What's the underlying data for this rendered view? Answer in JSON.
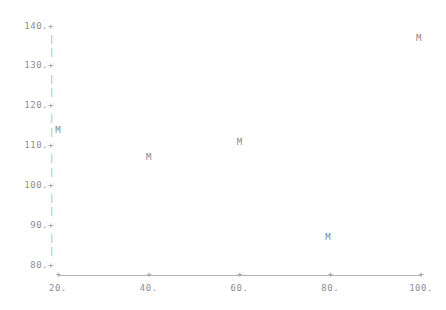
{
  "chart_data": {
    "type": "scatter",
    "title": "",
    "subtitle": "",
    "xlabel": "",
    "ylabel": "",
    "xlim": [
      20,
      100
    ],
    "ylim": [
      80,
      140
    ],
    "grid": false,
    "legend": null,
    "marker_symbol": "M",
    "x_ticks": [
      20,
      40,
      60,
      80,
      100
    ],
    "x_tick_labels": [
      "20.",
      "40.",
      "60.",
      "80.",
      "100."
    ],
    "y_ticks": [
      80,
      90,
      100,
      110,
      120,
      130,
      140
    ],
    "y_tick_labels": [
      "80.",
      "90.",
      "100.",
      "110.",
      "120.",
      "130.",
      "140."
    ],
    "y_tick_glyph": "+",
    "y_minor_glyph": "|",
    "x_tick_glyph": "+",
    "points": [
      {
        "x": 20.0,
        "y": 114.0,
        "label": "M"
      },
      {
        "x": 40.0,
        "y": 107.0,
        "label": "M"
      },
      {
        "x": 60.0,
        "y": 111.0,
        "label": "M"
      },
      {
        "x": 79.5,
        "y": 87.0,
        "label": "M"
      },
      {
        "x": 99.5,
        "y": 137.0,
        "label": "M"
      }
    ],
    "series": [
      {
        "name": "M",
        "x": [
          20.0,
          40.0,
          60.0,
          79.5,
          99.5
        ],
        "values": [
          114.0,
          107.0,
          111.0,
          87.0,
          137.0
        ]
      }
    ],
    "colors": {
      "marker": "#8a8a8a",
      "axis": "#b4b4b4",
      "tick_label": "#8e8e8e",
      "background": "#ffffff"
    }
  },
  "geometry": {
    "x_pixel_at_min": 58,
    "x_pixel_at_max": 421,
    "y_pixel_at_min": 265,
    "y_pixel_at_max": 26,
    "y_axis_column_x": 51,
    "y_minor_count_between": 2
  }
}
